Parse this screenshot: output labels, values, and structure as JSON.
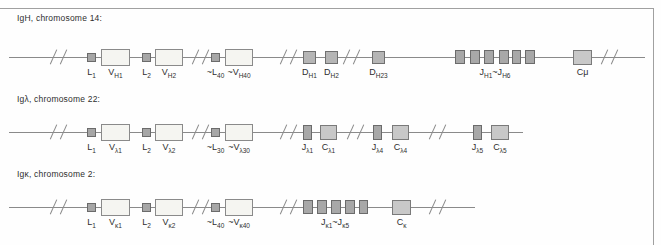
{
  "figure": {
    "colors": {
      "frame": "#a0a0a0",
      "line": "#8a8a8a",
      "label": "#2e2e2e",
      "box_styles": {
        "leader": {
          "fill": "#a6a6a6",
          "border": "#6b6b6b"
        },
        "variable": {
          "fill": "#f5f5f1",
          "border": "#8a8a8a"
        },
        "diversity": {
          "fill": "#b5b5b5",
          "border": "#707070"
        },
        "joining": {
          "fill": "#a8a8a8",
          "border": "#6b6b6b"
        },
        "constant": {
          "fill": "#c8c8c8",
          "border": "#7a7a7a"
        }
      }
    },
    "frame": {
      "top_y": 8,
      "right_x": 653,
      "height": 245,
      "width": 661
    },
    "rows": [
      {
        "name": "igh",
        "title": "IgH, chromosome 14:",
        "title_pos": {
          "x": 17,
          "y": 13
        },
        "line": {
          "y": 57,
          "x1": 9,
          "x2": 645
        },
        "breaks": [
          58,
          200,
          288,
          351,
          609
        ],
        "boxes": [
          {
            "name": "L1",
            "x": 87,
            "w": 9,
            "h": 9,
            "style": "leader",
            "label": [
              {
                "t": "L"
              },
              {
                "t": "1",
                "sub": true
              }
            ]
          },
          {
            "name": "VH1",
            "x": 101,
            "w": 29,
            "h": 17,
            "style": "variable",
            "label": [
              {
                "t": "V"
              },
              {
                "t": "H1",
                "sub": true
              }
            ]
          },
          {
            "name": "L2",
            "x": 142,
            "w": 9,
            "h": 9,
            "style": "leader",
            "label": [
              {
                "t": "L"
              },
              {
                "t": "2",
                "sub": true
              }
            ]
          },
          {
            "name": "VH2",
            "x": 155,
            "w": 28,
            "h": 17,
            "style": "variable",
            "label": [
              {
                "t": "V"
              },
              {
                "t": "H2",
                "sub": true
              }
            ]
          },
          {
            "name": "L40",
            "x": 211,
            "w": 9,
            "h": 9,
            "style": "leader",
            "label": [
              {
                "t": "~L"
              },
              {
                "t": "40",
                "sub": true
              }
            ]
          },
          {
            "name": "VH40",
            "x": 225,
            "w": 28,
            "h": 17,
            "style": "variable",
            "label": [
              {
                "t": "~V"
              },
              {
                "t": "H40",
                "sub": true
              }
            ]
          },
          {
            "name": "DH1",
            "x": 303,
            "w": 13,
            "h": 13,
            "style": "diversity",
            "label": [
              {
                "t": "D"
              },
              {
                "t": "H1",
                "sub": true
              }
            ]
          },
          {
            "name": "DH2",
            "x": 325,
            "w": 13,
            "h": 13,
            "style": "diversity",
            "label": [
              {
                "t": "D"
              },
              {
                "t": "H2",
                "sub": true
              }
            ]
          },
          {
            "name": "DH23",
            "x": 372,
            "w": 13,
            "h": 13,
            "style": "diversity",
            "label": [
              {
                "t": "D"
              },
              {
                "t": "H23",
                "sub": true
              }
            ]
          },
          {
            "name": "JH-1",
            "x": 455,
            "w": 10,
            "h": 14,
            "style": "joining"
          },
          {
            "name": "JH-2",
            "x": 470,
            "w": 10,
            "h": 14,
            "style": "joining"
          },
          {
            "name": "JH-3",
            "x": 484,
            "w": 10,
            "h": 14,
            "style": "joining"
          },
          {
            "name": "JH-4",
            "x": 499,
            "w": 10,
            "h": 14,
            "style": "joining"
          },
          {
            "name": "JH-5",
            "x": 512,
            "w": 9,
            "h": 14,
            "style": "joining"
          },
          {
            "name": "JH-6",
            "x": 525,
            "w": 10,
            "h": 14,
            "style": "joining"
          },
          {
            "name": "Cmu",
            "x": 573,
            "w": 19,
            "h": 15,
            "style": "constant",
            "label": [
              {
                "t": "Cμ"
              }
            ]
          }
        ],
        "group_labels": [
          {
            "name": "JH-range",
            "x": 495,
            "parts": [
              {
                "t": "J"
              },
              {
                "t": "H1",
                "sub": true
              },
              {
                "t": "~J"
              },
              {
                "t": "H6",
                "sub": true
              }
            ]
          }
        ]
      },
      {
        "name": "iglambda",
        "title": "Igλ, chromosome 22:",
        "title_pos": {
          "x": 17,
          "y": 94
        },
        "line": {
          "y": 132,
          "x1": 9,
          "x2": 523
        },
        "breaks": [
          58,
          200,
          288,
          355,
          437
        ],
        "boxes": [
          {
            "name": "L1",
            "x": 87,
            "w": 9,
            "h": 9,
            "style": "leader",
            "label": [
              {
                "t": "L"
              },
              {
                "t": "1",
                "sub": true
              }
            ]
          },
          {
            "name": "Vl1",
            "x": 101,
            "w": 29,
            "h": 17,
            "style": "variable",
            "label": [
              {
                "t": "V"
              },
              {
                "t": "λ1",
                "sub": true
              }
            ]
          },
          {
            "name": "L2",
            "x": 142,
            "w": 9,
            "h": 9,
            "style": "leader",
            "label": [
              {
                "t": "L"
              },
              {
                "t": "2",
                "sub": true
              }
            ]
          },
          {
            "name": "Vl2",
            "x": 155,
            "w": 28,
            "h": 17,
            "style": "variable",
            "label": [
              {
                "t": "V"
              },
              {
                "t": "λ2",
                "sub": true
              }
            ]
          },
          {
            "name": "L30",
            "x": 211,
            "w": 9,
            "h": 9,
            "style": "leader",
            "label": [
              {
                "t": "~L"
              },
              {
                "t": "30",
                "sub": true
              }
            ]
          },
          {
            "name": "Vl30",
            "x": 225,
            "w": 28,
            "h": 17,
            "style": "variable",
            "label": [
              {
                "t": "~V"
              },
              {
                "t": "λ30",
                "sub": true
              }
            ]
          },
          {
            "name": "Jl1",
            "x": 303,
            "w": 9,
            "h": 15,
            "style": "joining",
            "label": [
              {
                "t": "J"
              },
              {
                "t": "λ1",
                "sub": true
              }
            ]
          },
          {
            "name": "Cl1",
            "x": 320,
            "w": 17,
            "h": 15,
            "style": "constant",
            "label": [
              {
                "t": "C"
              },
              {
                "t": "λ1",
                "sub": true
              }
            ]
          },
          {
            "name": "Jl4",
            "x": 373,
            "w": 9,
            "h": 15,
            "style": "joining",
            "label": [
              {
                "t": "J"
              },
              {
                "t": "λ4",
                "sub": true
              }
            ]
          },
          {
            "name": "Cl4",
            "x": 392,
            "w": 17,
            "h": 15,
            "style": "constant",
            "label": [
              {
                "t": "C"
              },
              {
                "t": "λ4",
                "sub": true
              }
            ]
          },
          {
            "name": "Jl5",
            "x": 473,
            "w": 9,
            "h": 15,
            "style": "joining",
            "label": [
              {
                "t": "J"
              },
              {
                "t": "λ5",
                "sub": true
              }
            ]
          },
          {
            "name": "Cl5",
            "x": 491,
            "w": 18,
            "h": 15,
            "style": "constant",
            "label": [
              {
                "t": "C"
              },
              {
                "t": "λ5",
                "sub": true
              }
            ]
          }
        ],
        "group_labels": []
      },
      {
        "name": "igkappa",
        "title": "Igκ, chromosome 2:",
        "title_pos": {
          "x": 17,
          "y": 169
        },
        "line": {
          "y": 207,
          "x1": 9,
          "x2": 475
        },
        "breaks": [
          58,
          200,
          288,
          437
        ],
        "boxes": [
          {
            "name": "L1",
            "x": 87,
            "w": 9,
            "h": 9,
            "style": "leader",
            "label": [
              {
                "t": "L"
              },
              {
                "t": "1",
                "sub": true
              }
            ]
          },
          {
            "name": "Vk1",
            "x": 101,
            "w": 29,
            "h": 17,
            "style": "variable",
            "label": [
              {
                "t": "V"
              },
              {
                "t": "κ1",
                "sub": true
              }
            ]
          },
          {
            "name": "L2",
            "x": 142,
            "w": 9,
            "h": 9,
            "style": "leader",
            "label": [
              {
                "t": "L"
              },
              {
                "t": "2",
                "sub": true
              }
            ]
          },
          {
            "name": "Vk2",
            "x": 155,
            "w": 28,
            "h": 17,
            "style": "variable",
            "label": [
              {
                "t": "V"
              },
              {
                "t": "κ2",
                "sub": true
              }
            ]
          },
          {
            "name": "L40",
            "x": 211,
            "w": 9,
            "h": 9,
            "style": "leader",
            "label": [
              {
                "t": "~L"
              },
              {
                "t": "40",
                "sub": true
              }
            ]
          },
          {
            "name": "Vk40",
            "x": 225,
            "w": 28,
            "h": 17,
            "style": "variable",
            "label": [
              {
                "t": "~V"
              },
              {
                "t": "κ40",
                "sub": true
              }
            ]
          },
          {
            "name": "Jk-1",
            "x": 303,
            "w": 10,
            "h": 14,
            "style": "joining"
          },
          {
            "name": "Jk-2",
            "x": 317,
            "w": 10,
            "h": 14,
            "style": "joining"
          },
          {
            "name": "Jk-3",
            "x": 331,
            "w": 10,
            "h": 14,
            "style": "joining"
          },
          {
            "name": "Jk-4",
            "x": 345,
            "w": 10,
            "h": 14,
            "style": "joining"
          },
          {
            "name": "Jk-5",
            "x": 359,
            "w": 9,
            "h": 14,
            "style": "joining"
          },
          {
            "name": "Ck",
            "x": 392,
            "w": 19,
            "h": 15,
            "style": "constant",
            "label": [
              {
                "t": "C"
              },
              {
                "t": "κ",
                "sub": true
              }
            ]
          }
        ],
        "group_labels": [
          {
            "name": "Jk-range",
            "x": 335,
            "parts": [
              {
                "t": "J"
              },
              {
                "t": "κ1",
                "sub": true
              },
              {
                "t": "~J"
              },
              {
                "t": "κ5",
                "sub": true
              }
            ]
          }
        ]
      }
    ]
  }
}
